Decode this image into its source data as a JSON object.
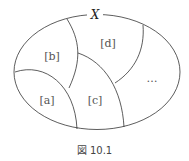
{
  "diagram": {
    "set_label": "X",
    "regions": [
      {
        "id": "a",
        "label": "[a]",
        "x": 47,
        "y": 100
      },
      {
        "id": "b",
        "label": "[b]",
        "x": 52,
        "y": 56
      },
      {
        "id": "c",
        "label": "[c]",
        "x": 95,
        "y": 100
      },
      {
        "id": "d",
        "label": "[d]",
        "x": 108,
        "y": 43
      },
      {
        "id": "more",
        "label": "…",
        "x": 152,
        "y": 78
      }
    ],
    "stroke_color": "#333333"
  },
  "caption": "図 10.1"
}
